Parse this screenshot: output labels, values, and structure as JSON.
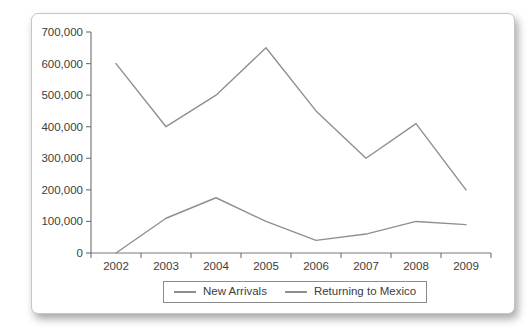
{
  "chart_data": {
    "type": "line",
    "title": "",
    "xlabel": "",
    "ylabel": "",
    "grid": false,
    "legend_position": "bottom-center",
    "categories": [
      "2002",
      "2003",
      "2004",
      "2005",
      "2006",
      "2007",
      "2008",
      "2009"
    ],
    "series": [
      {
        "name": "New Arrivals",
        "values": [
          600000,
          400000,
          500000,
          650000,
          450000,
          300000,
          410000,
          200000
        ],
        "color": "#8f8f8f"
      },
      {
        "name": "Returning to Mexico",
        "values": [
          0,
          110000,
          175000,
          100000,
          40000,
          60000,
          100000,
          90000
        ],
        "color": "#8f8f8f"
      }
    ],
    "ylim": [
      0,
      700000
    ],
    "ytick_values": [
      0,
      100000,
      200000,
      300000,
      400000,
      500000,
      600000,
      700000
    ],
    "ytick_labels": [
      "0",
      "100,000",
      "200,000",
      "300,000",
      "400,000",
      "500,000",
      "600,000",
      "700,000"
    ],
    "axis_color": "#7a7a7a",
    "text_color": "#3d3d3d"
  }
}
